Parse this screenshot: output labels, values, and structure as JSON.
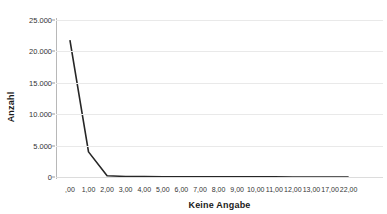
{
  "chart_data": {
    "type": "line",
    "title": "",
    "xlabel": "Keine Angabe",
    "ylabel": "Anzahl",
    "categories": [
      ",00",
      "1,00",
      "2,00",
      "3,00",
      "4,00",
      "5,00",
      "6,00",
      "7,00",
      "8,00",
      "9,00",
      "10,00",
      "11,00",
      "12,00",
      "13,00",
      "17,00",
      "22,00"
    ],
    "values": [
      21800,
      4000,
      200,
      90,
      60,
      45,
      35,
      28,
      22,
      18,
      15,
      12,
      10,
      8,
      5,
      3
    ],
    "x_tick_labels": [
      ",00",
      "1,00",
      "2,00",
      "3,00",
      "4,00",
      "5,00",
      "6,00",
      "7,00",
      "8,00",
      "9,00",
      "10,00",
      "11,00",
      "12,00",
      "13,00",
      "17,00",
      "22,00"
    ],
    "y_tick_labels": [
      "0",
      "5.000",
      "10.000",
      "15.000",
      "20.000",
      "25.000"
    ],
    "y_tick_values": [
      0,
      5000,
      10000,
      15000,
      20000,
      25000
    ],
    "ylim": [
      0,
      25000
    ],
    "grid": "horizontal",
    "legend": "none",
    "line_color": "#262626",
    "gridline_color": "#e9e9e9",
    "axis_color": "#b8b8b8",
    "background_color": "#ffffff"
  }
}
